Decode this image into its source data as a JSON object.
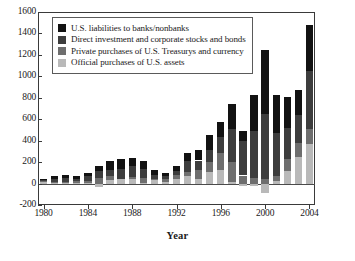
{
  "chart_data": {
    "type": "bar",
    "title": "",
    "subtitle": "",
    "xlabel": "Year",
    "ylabel": "",
    "stacked": true,
    "grid": false,
    "legend_position": "top-left-inside",
    "xlim": [
      1979.3,
      2004.7
    ],
    "ylim": [
      -200,
      1600
    ],
    "ytick_values": [
      1600,
      1400,
      1200,
      1000,
      800,
      600,
      400,
      200,
      0,
      -200
    ],
    "ytick_labels": [
      "1600",
      "1400",
      "1200",
      "1000",
      "800",
      "600",
      "400",
      "200",
      "0",
      "-200"
    ],
    "xtick_values": [
      1980,
      1984,
      1988,
      1992,
      1996,
      2000,
      2004
    ],
    "xtick_labels": [
      "1980",
      "1984",
      "1988",
      "1992",
      "1996",
      "2000",
      "2004"
    ],
    "categories": [
      1980,
      1981,
      1982,
      1983,
      1984,
      1985,
      1986,
      1987,
      1988,
      1989,
      1990,
      1991,
      1992,
      1993,
      1994,
      1995,
      1996,
      1997,
      1998,
      1999,
      2000,
      2001,
      2002,
      2003,
      2004
    ],
    "series": [
      {
        "name": "Official purchases of U.S. assets",
        "color": "#b9b9b9",
        "values": [
          15,
          5,
          3,
          5,
          3,
          -35,
          34,
          45,
          39,
          8,
          33,
          17,
          40,
          71,
          40,
          110,
          127,
          19,
          -20,
          -25,
          -90,
          28,
          115,
          250,
          370
        ]
      },
      {
        "name": "Private purchases of U.S. Treasurys and currency",
        "color": "#6e6e6e",
        "values": [
          5,
          10,
          10,
          15,
          25,
          50,
          40,
          0,
          25,
          45,
          5,
          30,
          40,
          35,
          90,
          95,
          160,
          180,
          75,
          55,
          40,
          40,
          110,
          130,
          140
        ]
      },
      {
        "name": "Direct investment and corporate stocks and bonds",
        "color": "#3d3d3d",
        "values": [
          15,
          25,
          35,
          25,
          40,
          70,
          55,
          90,
          100,
          85,
          45,
          25,
          40,
          105,
          85,
          105,
          150,
          310,
          320,
          435,
          605,
          400,
          290,
          260,
          540
        ]
      },
      {
        "name": "U.S. liabilities to banks/nonbanks",
        "color": "#121212",
        "values": [
          10,
          30,
          30,
          25,
          35,
          45,
          85,
          95,
          70,
          70,
          45,
          25,
          40,
          70,
          95,
          145,
          140,
          230,
          95,
          340,
          605,
          355,
          295,
          230,
          430
        ]
      }
    ]
  },
  "legend": {
    "items": [
      {
        "label": "U.S. liabilities to banks/nonbanks",
        "color": "#121212"
      },
      {
        "label": "Direct investment and corporate stocks and bonds",
        "color": "#3d3d3d"
      },
      {
        "label": "Private purchases of U.S. Treasurys and currency",
        "color": "#6e6e6e"
      },
      {
        "label": "Official purchases of U.S. assets",
        "color": "#b9b9b9"
      }
    ]
  }
}
